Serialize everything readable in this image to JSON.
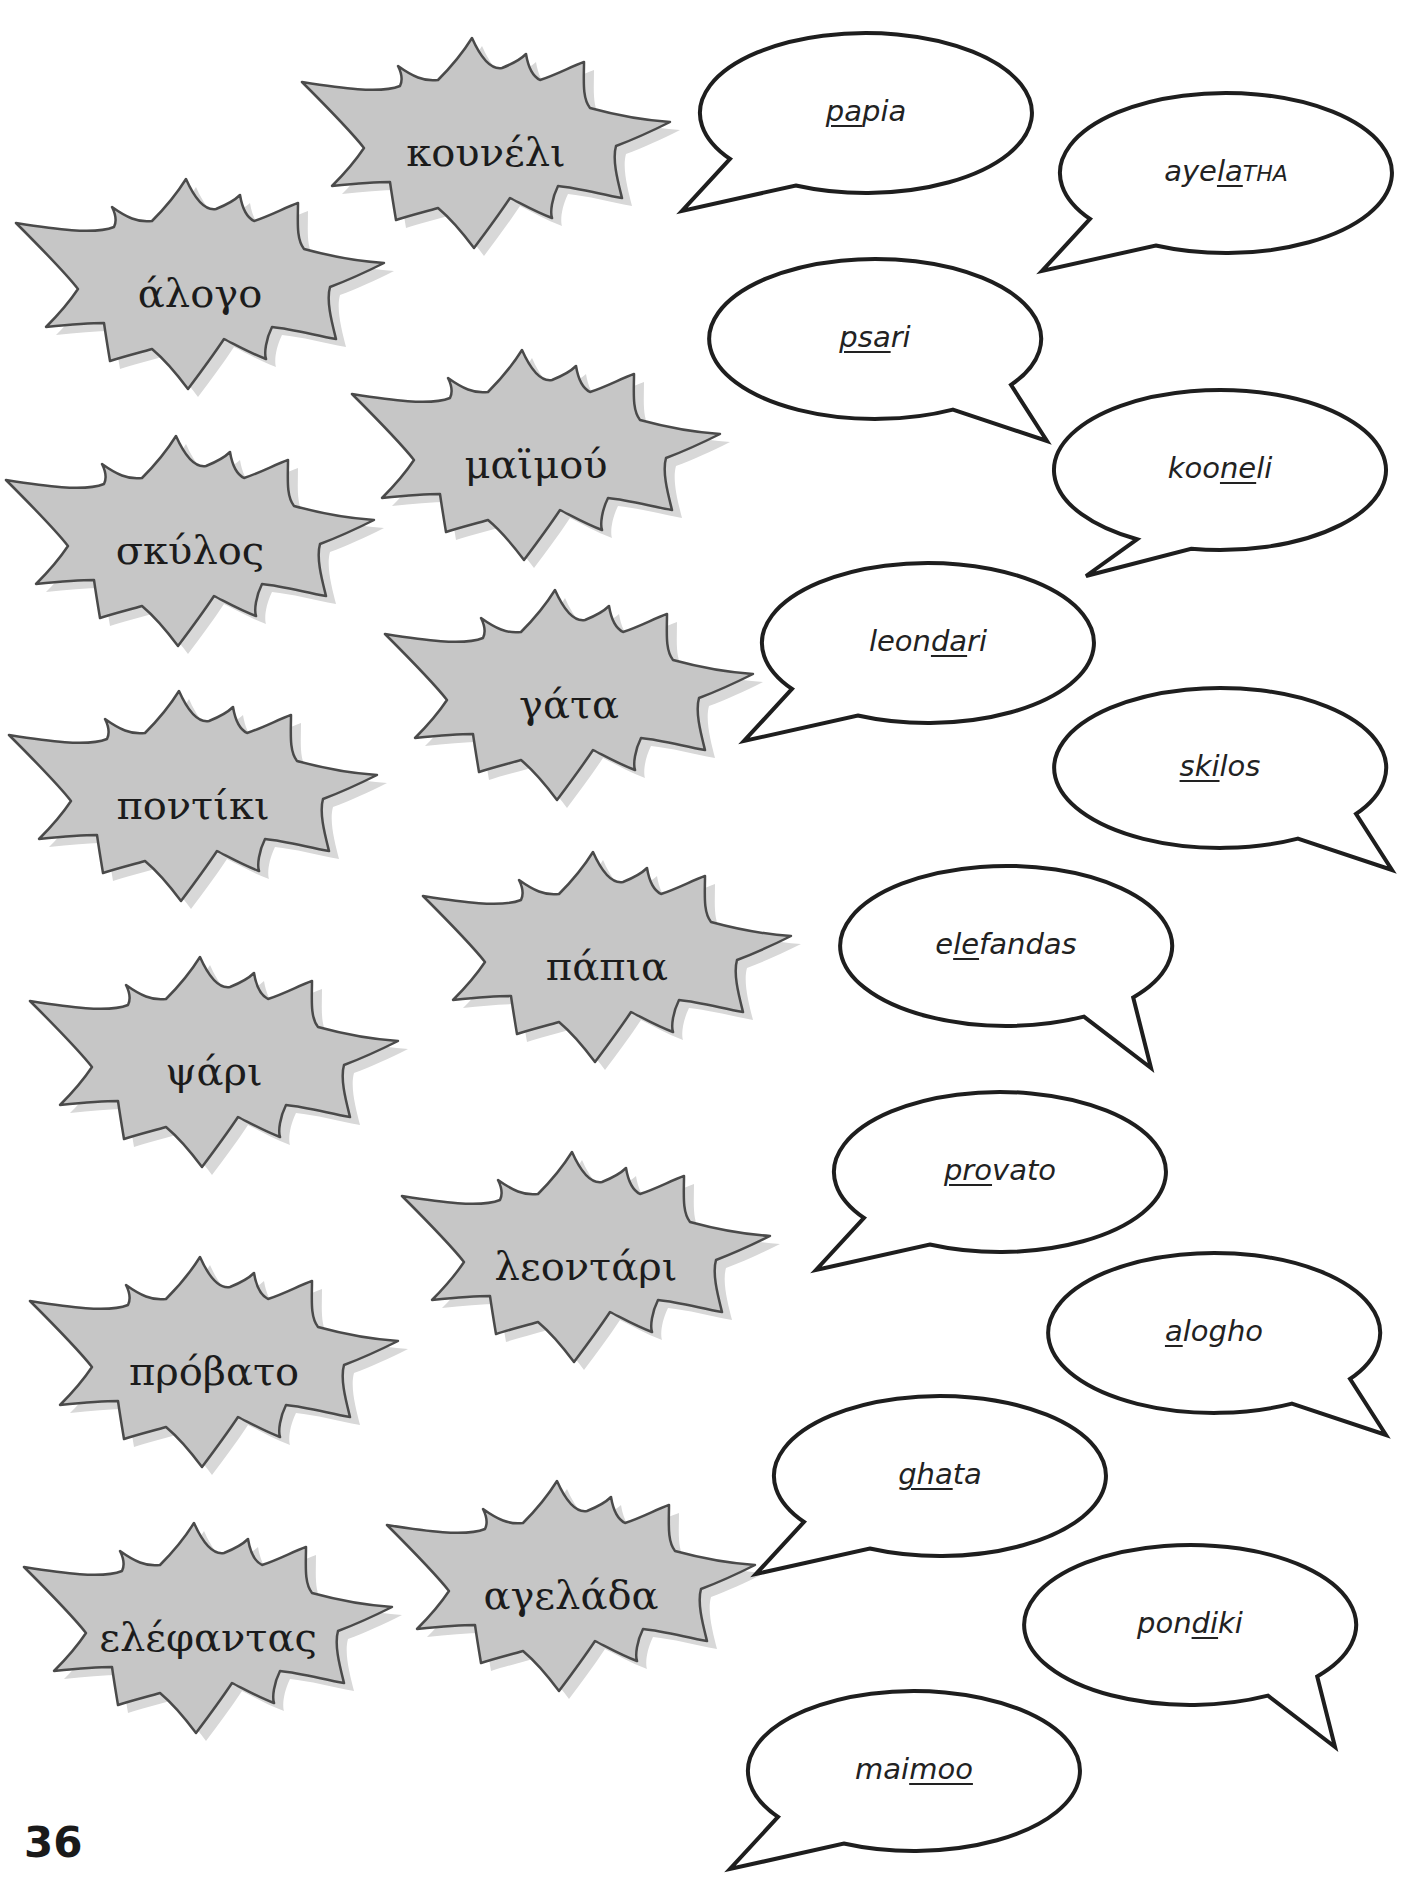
{
  "page": {
    "number": "36",
    "colors": {
      "burst_fill": "#c6c6c6",
      "burst_shadow": "#d8d8d8",
      "burst_stroke": "#4a4a4a",
      "bubble_stroke": "#1e1e1e",
      "text": "#1c1c1c"
    }
  },
  "greek_words": [
    {
      "id": "kouneli",
      "text": "κουνέλι",
      "x": 486,
      "y": 152
    },
    {
      "id": "alogo",
      "text": "άλογο",
      "x": 200,
      "y": 293
    },
    {
      "id": "maimou",
      "text": "μαϊμού",
      "x": 536,
      "y": 464
    },
    {
      "id": "skylos",
      "text": "σκύλος",
      "x": 190,
      "y": 550
    },
    {
      "id": "gata",
      "text": "γάτα",
      "x": 569,
      "y": 704
    },
    {
      "id": "pontiki",
      "text": "ποντίκι",
      "x": 193,
      "y": 805
    },
    {
      "id": "papia",
      "text": "πάπια",
      "x": 607,
      "y": 966
    },
    {
      "id": "psari",
      "text": "ψάρι",
      "x": 214,
      "y": 1071
    },
    {
      "id": "leontari",
      "text": "λεοντάρι",
      "x": 586,
      "y": 1266
    },
    {
      "id": "provato",
      "text": "πρόβατο",
      "x": 214,
      "y": 1371
    },
    {
      "id": "agelada",
      "text": "αγελάδα",
      "x": 571,
      "y": 1595
    },
    {
      "id": "elefantas",
      "text": "ελέφαντας",
      "x": 208,
      "y": 1637
    }
  ],
  "pronunciations": [
    {
      "id": "papia",
      "pre": "",
      "stress": "pa",
      "post": "pia",
      "small_caps": "",
      "x": 866,
      "y": 113,
      "tail": "left-down"
    },
    {
      "id": "ayelatha",
      "pre": "aye",
      "stress": "la",
      "post": "",
      "small_caps": "THA",
      "x": 1226,
      "y": 173,
      "tail": "left-down"
    },
    {
      "id": "psari",
      "pre": "",
      "stress": "psa",
      "post": "ri",
      "small_caps": "",
      "x": 875,
      "y": 339,
      "tail": "right-down"
    },
    {
      "id": "kooneli",
      "pre": "koo",
      "stress": "ne",
      "post": "li",
      "small_caps": "",
      "x": 1220,
      "y": 470,
      "tail": "down-left"
    },
    {
      "id": "leondari",
      "pre": "leon",
      "stress": "da",
      "post": "ri",
      "small_caps": "",
      "x": 928,
      "y": 643,
      "tail": "left-down"
    },
    {
      "id": "skilos",
      "pre": "",
      "stress": "ski",
      "post": "los",
      "small_caps": "",
      "x": 1220,
      "y": 768,
      "tail": "right-down"
    },
    {
      "id": "elefandas",
      "pre": "e",
      "stress": "le",
      "post": "fandas",
      "small_caps": "",
      "x": 1006,
      "y": 946,
      "tail": "down-right"
    },
    {
      "id": "provato",
      "pre": "",
      "stress": "pro",
      "post": "vato",
      "small_caps": "",
      "x": 1000,
      "y": 1172,
      "tail": "left-down"
    },
    {
      "id": "alogho",
      "pre": "",
      "stress": "a",
      "post": "logho",
      "small_caps": "",
      "x": 1214,
      "y": 1333,
      "tail": "right-down"
    },
    {
      "id": "ghata",
      "pre": "",
      "stress": "gha",
      "post": "ta",
      "small_caps": "",
      "x": 940,
      "y": 1476,
      "tail": "left-down"
    },
    {
      "id": "pondiki",
      "pre": "pon",
      "stress": "di",
      "post": "ki",
      "small_caps": "",
      "x": 1190,
      "y": 1625,
      "tail": "down-right"
    },
    {
      "id": "maimoo",
      "pre": "mai",
      "stress": "moo",
      "post": "",
      "small_caps": "",
      "x": 914,
      "y": 1771,
      "tail": "left-down"
    }
  ]
}
